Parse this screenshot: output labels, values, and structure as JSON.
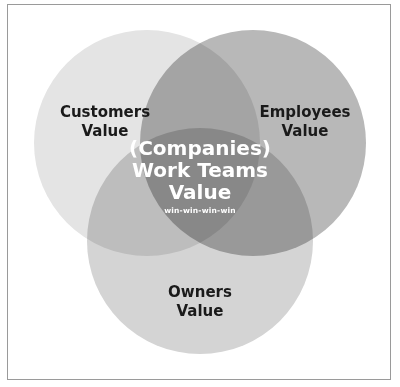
{
  "diagram": {
    "type": "venn",
    "circles": [
      {
        "id": "customers",
        "label_line1": "Customers",
        "label_line2": "Value",
        "color": "#e4e4e4"
      },
      {
        "id": "employees",
        "label_line1": "Employees",
        "label_line2": "Value",
        "color": "#b7b7b7"
      },
      {
        "id": "owners",
        "label_line1": "Owners",
        "label_line2": "Value",
        "color": "#d2d2d2"
      }
    ],
    "center": {
      "line1": "(Companies)",
      "line2": "Work Teams",
      "line3": "Value",
      "subtitle": "win-win-win-win",
      "color": "#8a8a8a"
    }
  }
}
